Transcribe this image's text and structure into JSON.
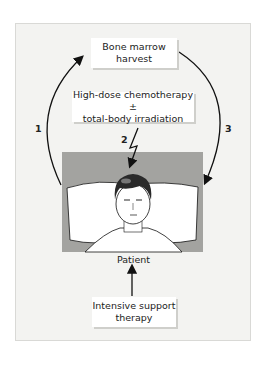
{
  "boxes": {
    "harvest": {
      "line1": "Bone marrow",
      "line2": "harvest"
    },
    "chemo": {
      "line1": "High-dose chemotherapy ±",
      "line2": "total-body irradiation"
    },
    "support": {
      "line1": "Intensive support",
      "line2": "therapy"
    }
  },
  "patient_label": "Patient",
  "steps": [
    "1",
    "2",
    "3"
  ],
  "colors": {
    "frame": "#f3f3f1",
    "panel": "#9d9d9a",
    "ink": "#111111",
    "pillow": "#ffffff",
    "hair": "#2a2a2a"
  }
}
